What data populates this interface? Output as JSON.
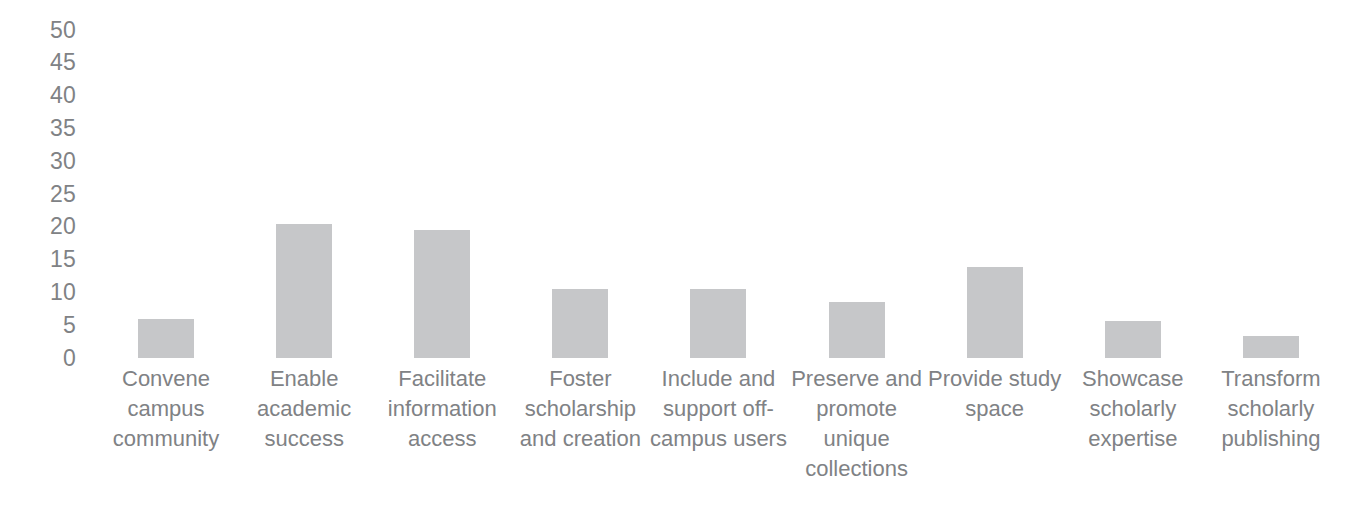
{
  "chart_data": {
    "type": "bar",
    "title": "",
    "subtitle": "",
    "xlabel": "",
    "ylabel": "",
    "ylim": [
      0,
      50
    ],
    "ytick_step": 5,
    "grid": false,
    "legend": null,
    "bar_color": "#c6c7c9",
    "axis_text_color": "#808285",
    "background": "#ffffff",
    "categories": [
      "Convene campus community",
      "Enable academic success",
      "Facilitate information access",
      "Foster scholarship and creation",
      "Include and support off-campus users",
      "Preserve and promote unique collections",
      "Provide study space",
      "Showcase scholarly expertise",
      "Transform scholarly publishing"
    ],
    "values": [
      6,
      20.5,
      19.5,
      10.5,
      10.5,
      8.5,
      13.8,
      5.7,
      3.3
    ],
    "yticks": [
      "50",
      "45",
      "40",
      "35",
      "30",
      "25",
      "20",
      "15",
      "10",
      "5",
      "0"
    ],
    "ytick_values": [
      50,
      45,
      40,
      35,
      30,
      25,
      20,
      15,
      10,
      5,
      0
    ]
  }
}
